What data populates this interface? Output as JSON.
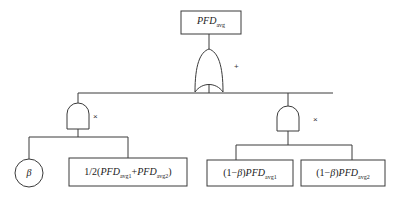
{
  "diagram": {
    "type": "fault-tree",
    "top_event": {
      "main": "PFD",
      "sub": "avg"
    },
    "or_gate": {
      "symbol": "+"
    },
    "left_and_gate": {
      "symbol": "×"
    },
    "right_and_gate": {
      "symbol": "×"
    },
    "leaves": {
      "beta_circle": {
        "label": "β"
      },
      "half_sum": {
        "prefix": "1/2(",
        "t1": "PFD",
        "s1": "avg1",
        "plus": "+",
        "t2": "PFD",
        "s2": "avg2",
        "suffix": ")"
      },
      "indep1": {
        "prefix": "(1−",
        "beta": "β",
        "close": ")",
        "t": "PFD",
        "s": "avg1"
      },
      "indep2": {
        "prefix": "(1−",
        "beta": "β",
        "close": ")",
        "t": "PFD",
        "s": "avg2"
      }
    },
    "colors": {
      "stroke": "#3a3a3a",
      "background": "#ffffff"
    }
  }
}
